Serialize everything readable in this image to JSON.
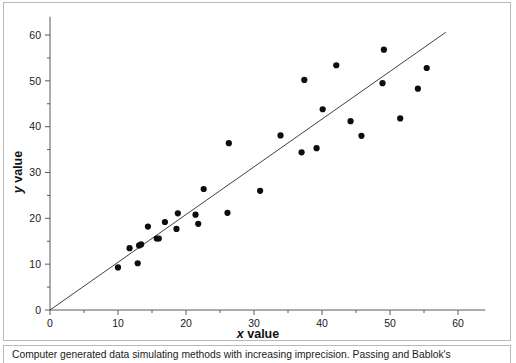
{
  "figure": {
    "caption": "Computer generated data simulating methods with increasing imprecision. Passing and Bablok's",
    "background_color": "#ffffff",
    "frame_color": "#b9b9b9"
  },
  "chart_data": {
    "type": "scatter",
    "title": "",
    "xlabel": "x value",
    "ylabel": "y value",
    "xlabel_variable": "x",
    "xlabel_rest": " value",
    "ylabel_variable": "y",
    "ylabel_rest": " value",
    "xlim": [
      0,
      64
    ],
    "ylim": [
      0,
      64
    ],
    "xticks": [
      0,
      10,
      20,
      30,
      40,
      50,
      60
    ],
    "yticks": [
      0,
      10,
      20,
      30,
      40,
      50,
      60
    ],
    "xtick_labels": [
      "0",
      "10",
      "20",
      "30",
      "40",
      "50",
      "60"
    ],
    "ytick_labels": [
      "0",
      "10",
      "20",
      "30",
      "40",
      "50",
      "60"
    ],
    "minor_tick_interval": 5,
    "grid": false,
    "legend": null,
    "marker": {
      "shape": "circle",
      "color": "#0d0d0d",
      "size_px": 4.1
    },
    "series": [
      {
        "name": "Computer generated data",
        "points": [
          [
            10.0,
            9.3
          ],
          [
            11.7,
            13.5
          ],
          [
            12.9,
            10.2
          ],
          [
            13.1,
            14.1
          ],
          [
            13.4,
            14.3
          ],
          [
            14.4,
            18.2
          ],
          [
            15.7,
            15.6
          ],
          [
            16.0,
            15.6
          ],
          [
            16.9,
            19.2
          ],
          [
            18.6,
            17.7
          ],
          [
            18.8,
            21.1
          ],
          [
            21.4,
            20.8
          ],
          [
            21.8,
            18.8
          ],
          [
            22.6,
            26.4
          ],
          [
            26.1,
            21.2
          ],
          [
            26.3,
            36.4
          ],
          [
            30.9,
            26.0
          ],
          [
            33.9,
            38.1
          ],
          [
            37.0,
            34.4
          ],
          [
            37.4,
            50.2
          ],
          [
            39.2,
            35.3
          ],
          [
            40.1,
            43.8
          ],
          [
            42.1,
            53.4
          ],
          [
            44.2,
            41.2
          ],
          [
            45.8,
            38.0
          ],
          [
            48.9,
            49.5
          ],
          [
            49.1,
            56.8
          ],
          [
            51.5,
            41.8
          ],
          [
            54.1,
            48.3
          ],
          [
            55.4,
            52.8
          ]
        ]
      }
    ],
    "fit_line": {
      "name": "Passing-Bablok regression line",
      "x_start": 0.0,
      "y_start": 0.0,
      "x_end": 58.2,
      "y_end": 60.6,
      "color": "#2b2b2b"
    }
  }
}
